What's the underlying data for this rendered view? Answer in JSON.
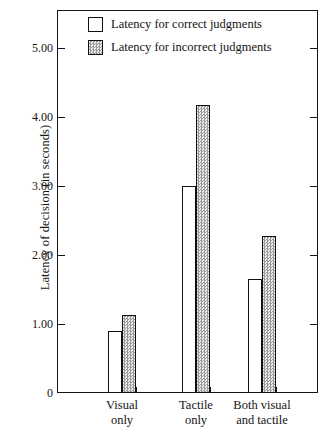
{
  "chart_data": {
    "type": "bar",
    "title": "",
    "subtitle": "",
    "xlabel": "",
    "ylabel": "Latency of decision (in seconds)",
    "categories": [
      "Visual only",
      "Tactile only",
      "Both visual and tactile"
    ],
    "category_lines": [
      [
        "Visual",
        "only"
      ],
      [
        "Tactile",
        "only"
      ],
      [
        "Both visual",
        "and tactile"
      ]
    ],
    "series": [
      {
        "name": "Latency for correct judgments",
        "fill": "white",
        "values": [
          0.9,
          3.0,
          1.65
        ]
      },
      {
        "name": "Latency for incorrect judgments",
        "fill": "gray-stipple",
        "values": [
          1.13,
          4.18,
          2.28
        ]
      }
    ],
    "ylim": [
      0,
      5.55
    ],
    "yticks": [
      0,
      1.0,
      2.0,
      3.0,
      4.0,
      5.0
    ],
    "ytick_labels": [
      "0",
      "1.00",
      "2.00",
      "3.00",
      "4.00",
      "5.00"
    ],
    "grid": false,
    "legend_position": "top-center",
    "colors": {
      "axis": "#151515",
      "bar_outline": "#111111",
      "bar_correct_fill": "#ffffff",
      "bar_incorrect_fill": "#d9d9d9",
      "background": "#ffffff"
    }
  },
  "legend": {
    "items": [
      {
        "label": "Latency for correct judgments",
        "swatch": "white-square-icon"
      },
      {
        "label": "Latency for incorrect judgments",
        "swatch": "stippled-square-icon"
      }
    ]
  },
  "axes": {
    "y_title": "Latency of decision (in seconds)",
    "y_labels": [
      "5.00",
      "4.00",
      "3.00",
      "2.00",
      "1.00",
      "0"
    ]
  }
}
